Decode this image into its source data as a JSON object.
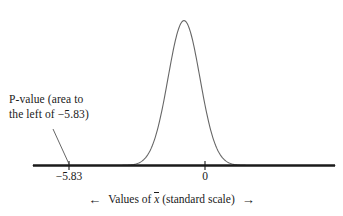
{
  "figure": {
    "background": "#ffffff",
    "curve_color": "#666666",
    "axis_color": "#1a1a1a",
    "text_color": "#1a1a1a"
  },
  "annotation": {
    "line1": "P-value (area to",
    "line2": "the left of −5.83)",
    "full_text": "P-value (area to the left of −5.83)"
  },
  "axis": {
    "title_prefix": "Values of",
    "title_symbol": "x",
    "title_suffix": "(standard scale)",
    "arrow_left": "←",
    "arrow_right": "→",
    "ticks": [
      {
        "label": "−5.83",
        "value": -5.83
      },
      {
        "label": "0",
        "value": 0
      }
    ]
  },
  "chart_data": {
    "type": "line",
    "title": "",
    "subtitle": "",
    "xlabel": "Values of x̄ (standard scale)",
    "ylabel": "",
    "grid": false,
    "legend": "none",
    "distribution": "standard normal density",
    "mean": 0,
    "sd": 1,
    "xlim": [
      -9.5,
      9.5
    ],
    "ylim": [
      0,
      0.42
    ],
    "tick_labels": [
      "−5.83",
      "0"
    ],
    "tick_values": [
      -5.83,
      0
    ],
    "annotations": [
      {
        "text": "P-value (area to the left of −5.83)",
        "points_to": -5.83,
        "type": "leader-line"
      }
    ],
    "x": [
      -9.5,
      -9.0,
      -8.5,
      -8.0,
      -7.5,
      -7.0,
      -6.5,
      -6.0,
      -5.5,
      -5.0,
      -4.5,
      -4.0,
      -3.5,
      -3.0,
      -2.5,
      -2.0,
      -1.5,
      -1.0,
      -0.5,
      0.0,
      0.5,
      1.0,
      1.5,
      2.0,
      2.5,
      3.0,
      3.5,
      4.0,
      4.5,
      5.0,
      5.5,
      6.0,
      6.5,
      7.0,
      7.5,
      8.0,
      8.5,
      9.0,
      9.5
    ],
    "y": [
      0.0,
      0.0,
      0.0,
      0.0,
      0.0,
      0.0,
      0.0,
      0.0,
      0.0,
      0.0,
      0.0,
      0.0001,
      0.0009,
      0.0044,
      0.0175,
      0.054,
      0.1295,
      0.242,
      0.3521,
      0.3989,
      0.3521,
      0.242,
      0.1295,
      0.054,
      0.0175,
      0.0044,
      0.0009,
      0.0001,
      0.0,
      0.0,
      0.0,
      0.0,
      0.0,
      0.0,
      0.0,
      0.0,
      0.0,
      0.0,
      0.0
    ],
    "series": [
      {
        "name": "standard normal density",
        "values": [
          0.0,
          0.0,
          0.0,
          0.0,
          0.0,
          0.0,
          0.0,
          0.0,
          0.0,
          0.0,
          0.0,
          0.0001,
          0.0009,
          0.0044,
          0.0175,
          0.054,
          0.1295,
          0.242,
          0.3521,
          0.3989,
          0.3521,
          0.242,
          0.1295,
          0.054,
          0.0175,
          0.0044,
          0.0009,
          0.0001,
          0.0,
          0.0,
          0.0,
          0.0,
          0.0,
          0.0,
          0.0,
          0.0,
          0.0,
          0.0,
          0.0
        ]
      }
    ]
  }
}
